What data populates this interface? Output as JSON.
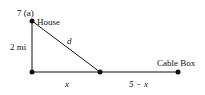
{
  "problem_label": "7  (a)",
  "points": {
    "house": {
      "label": "House",
      "x": 32,
      "y": 21
    },
    "corner": {
      "x": 32,
      "y": 72
    },
    "junction": {
      "x": 100,
      "y": 72
    },
    "cable_box": {
      "label": "Cable Box",
      "x": 178,
      "y": 72
    }
  },
  "edge_labels": {
    "vertical": "2 mi",
    "hypotenuse": "d",
    "left_segment": "x",
    "right_segment": "5 − x"
  },
  "colors": {
    "line": "#111111",
    "background": "#ffffff"
  }
}
